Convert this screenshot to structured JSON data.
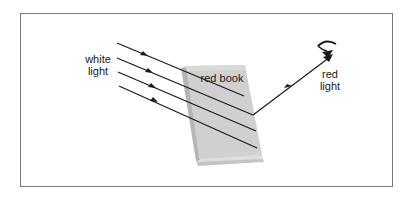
{
  "diagram": {
    "labels": {
      "incident": [
        "white",
        "light"
      ],
      "object": "red book",
      "reflected": [
        "red",
        "light"
      ]
    },
    "colors": {
      "frame": "#7a7a7a",
      "book_cover": "#cfcfcf",
      "book_shadow": "#b8b8b8",
      "book_pages": "#d9d9d9",
      "rays": "#1a1a1a"
    },
    "incident_ray_count": 4,
    "reflected_ray_count": 1
  }
}
